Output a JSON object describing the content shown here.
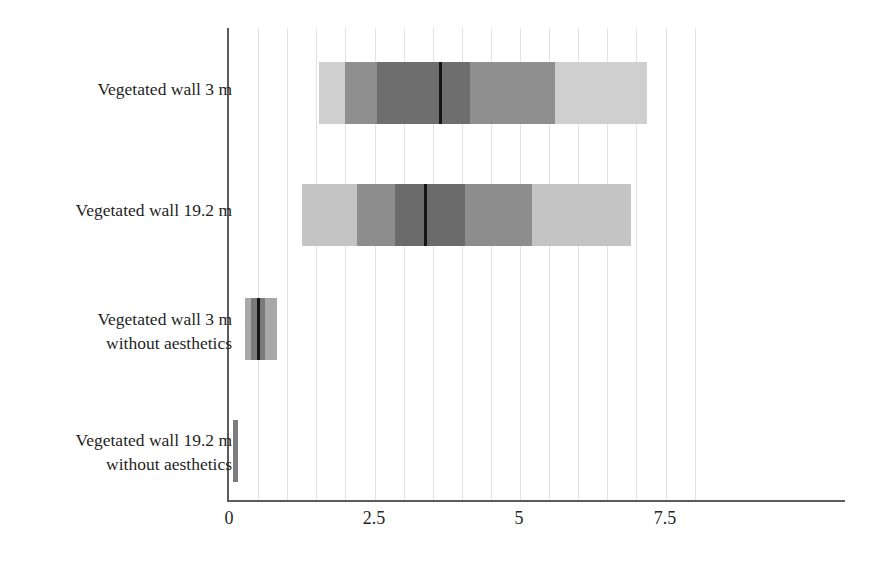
{
  "chart_data": {
    "type": "bar",
    "subtype": "tornado-uncertainty-range",
    "title": "",
    "xlabel": "",
    "ylabel": "",
    "xlim": [
      0,
      8.1
    ],
    "xticks": [
      0,
      2.5,
      5,
      7.5
    ],
    "xtick_labels": [
      "0",
      "2.5",
      "5",
      "7.5"
    ],
    "gridlines": {
      "visible": true,
      "orientation": "vertical",
      "interval": 0.5,
      "color": "#e2e2e2"
    },
    "categories": [
      "Vegetated wall 3 m",
      "Vegetated wall 19.2 m",
      "Vegetated wall 3 m\nwithout aesthetics",
      "Vegetated wall 19.2 m\nwithout aesthetics"
    ],
    "series": [
      {
        "name": "Vegetated wall 3 m",
        "start": 1.55,
        "end": 7.19,
        "median": 3.63,
        "bands": [
          {
            "from": 1.55,
            "to": 2.0,
            "color": "#cfcfcf"
          },
          {
            "from": 2.0,
            "to": 2.55,
            "color": "#8f8f8f"
          },
          {
            "from": 2.55,
            "to": 3.63,
            "color": "#6e6e6e"
          },
          {
            "from": 3.63,
            "to": 4.15,
            "color": "#6e6e6e"
          },
          {
            "from": 4.15,
            "to": 5.05,
            "color": "#8f8f8f"
          },
          {
            "from": 5.05,
            "to": 5.6,
            "color": "#8f8f8f"
          },
          {
            "from": 5.6,
            "to": 7.19,
            "color": "#cfcfcf"
          }
        ]
      },
      {
        "name": "Vegetated wall 19.2 m",
        "start": 1.25,
        "end": 6.9,
        "median": 3.36,
        "bands": [
          {
            "from": 1.25,
            "to": 2.2,
            "color": "#c4c4c4"
          },
          {
            "from": 2.2,
            "to": 2.85,
            "color": "#8d8d8d"
          },
          {
            "from": 2.85,
            "to": 3.36,
            "color": "#6b6b6b"
          },
          {
            "from": 3.36,
            "to": 4.05,
            "color": "#6b6b6b"
          },
          {
            "from": 4.05,
            "to": 4.55,
            "color": "#8d8d8d"
          },
          {
            "from": 4.55,
            "to": 5.2,
            "color": "#8d8d8d"
          },
          {
            "from": 5.2,
            "to": 6.9,
            "color": "#c4c4c4"
          }
        ]
      },
      {
        "name": "Vegetated wall 3 m without aesthetics",
        "start": 0.27,
        "end": 0.82,
        "median": 0.5,
        "bands": [
          {
            "from": 0.27,
            "to": 0.38,
            "color": "#a8a8a8"
          },
          {
            "from": 0.38,
            "to": 0.5,
            "color": "#7a7a7a"
          },
          {
            "from": 0.5,
            "to": 0.62,
            "color": "#7a7a7a"
          },
          {
            "from": 0.62,
            "to": 0.82,
            "color": "#a8a8a8"
          }
        ]
      },
      {
        "name": "Vegetated wall 19.2 m without aesthetics",
        "start": 0.07,
        "end": 0.16,
        "median": 0.11,
        "bands": [
          {
            "from": 0.07,
            "to": 0.16,
            "color": "#7d7d7d"
          }
        ]
      }
    ]
  },
  "axis": {
    "tick_0": "0",
    "tick_1": "2.5",
    "tick_2": "5",
    "tick_3": "7.5",
    "axis_color": "#5b5b5b"
  },
  "labels": {
    "cat_0": "Vegetated wall 3 m",
    "cat_1": "Vegetated wall 19.2 m",
    "cat_2": "Vegetated wall 3 m\nwithout aesthetics",
    "cat_3": "Vegetated wall 19.2 m\nwithout aesthetics"
  }
}
